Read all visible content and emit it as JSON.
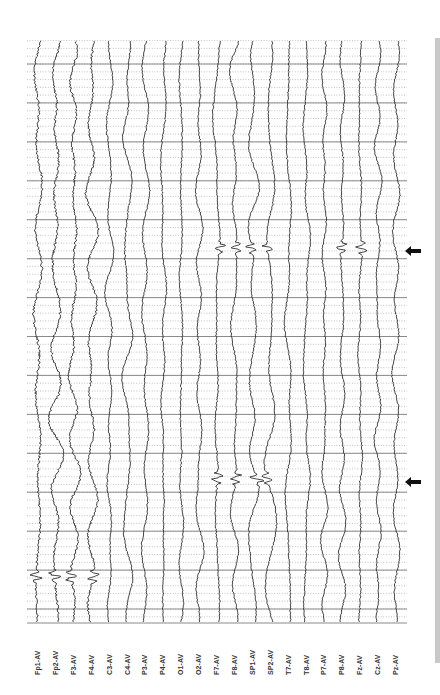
{
  "figure": {
    "type": "eeg-recording",
    "montage": "average-reference"
  },
  "chart_data": {
    "type": "line",
    "title": "",
    "orientation": "rotated-90",
    "xlabel": "",
    "ylabel": "",
    "grid": true,
    "channels": [
      {
        "label": "Fp1-AV"
      },
      {
        "label": "Fp2-AV"
      },
      {
        "label": "F3-AV"
      },
      {
        "label": "F4-AV"
      },
      {
        "label": "C3-AV"
      },
      {
        "label": "C4-AV"
      },
      {
        "label": "P3-AV"
      },
      {
        "label": "P4-AV"
      },
      {
        "label": "O1-AV"
      },
      {
        "label": "O2-AV"
      },
      {
        "label": "F7-AV"
      },
      {
        "label": "F8-AV"
      },
      {
        "label": "SP1-AV"
      },
      {
        "label": "SP2-AV"
      },
      {
        "label": "T7-AV"
      },
      {
        "label": "T8-AV"
      },
      {
        "label": "P7-AV"
      },
      {
        "label": "P8-AV"
      },
      {
        "label": "Fz-AV"
      },
      {
        "label": "Cz-AV"
      },
      {
        "label": "Pz-AV"
      }
    ],
    "seconds_shown": 15,
    "minor_divisions_per_second": 5,
    "events": [
      {
        "name": "discharge-1",
        "position": 0.356,
        "channels": [
          "F7-AV",
          "F8-AV",
          "SP1-AV",
          "SP2-AV",
          "P8-AV",
          "Fz-AV"
        ],
        "marked_with_arrow": true
      },
      {
        "name": "discharge-2",
        "position": 0.752,
        "channels": [
          "F7-AV",
          "F8-AV",
          "SP1-AV",
          "SP2-AV"
        ],
        "marked_with_arrow": true
      },
      {
        "name": "onset-artifact",
        "position": 0.92,
        "channels": [
          "Fp1-AV",
          "Fp2-AV",
          "F3-AV",
          "F4-AV"
        ],
        "marked_with_arrow": false
      }
    ]
  },
  "markers": [
    {
      "name": "arrow-discharge-1",
      "direction": "left",
      "y": 247
    },
    {
      "name": "arrow-discharge-2",
      "direction": "left",
      "y": 478
    }
  ],
  "colors": {
    "trace": "#1a1a1a",
    "grid_major": "#8a8a8a",
    "grid_minor": "#9a9a9a",
    "arrow": "#111111",
    "side_bar": "#c9c9c9"
  }
}
